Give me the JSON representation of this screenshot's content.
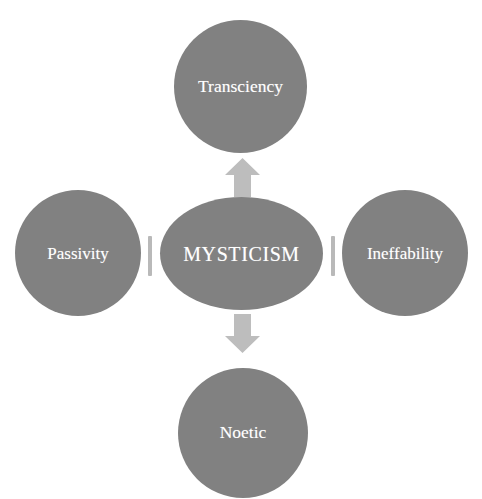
{
  "diagram": {
    "type": "hub-and-spoke",
    "background_color": "#ffffff",
    "shape_fill_color": "#818181",
    "label_color": "#ffffff",
    "connector_color": "#b9b9b9",
    "center": {
      "label": "MYSTICISM",
      "shape": "ellipse"
    },
    "nodes": [
      {
        "id": "transciency",
        "label": "Transciency",
        "shape": "circle",
        "position": "top"
      },
      {
        "id": "passivity",
        "label": "Passivity",
        "shape": "circle",
        "position": "left"
      },
      {
        "id": "ineffability",
        "label": "Ineffability",
        "shape": "circle",
        "position": "right"
      },
      {
        "id": "noetic",
        "label": "Noetic",
        "shape": "circle",
        "position": "bottom"
      }
    ],
    "connectors": [
      {
        "id": "arrow-up",
        "icon": "arrow-up-icon",
        "from": "MYSTICISM",
        "to": "Transciency"
      },
      {
        "id": "arrow-down",
        "icon": "arrow-down-icon",
        "from": "MYSTICISM",
        "to": "Noetic"
      },
      {
        "id": "connector-left",
        "icon": "vertical-bar-icon",
        "from": "MYSTICISM",
        "to": "Passivity"
      },
      {
        "id": "connector-right",
        "icon": "vertical-bar-icon",
        "from": "MYSTICISM",
        "to": "Ineffability"
      }
    ]
  }
}
